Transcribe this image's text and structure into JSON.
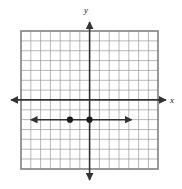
{
  "figure": {
    "background_color": "#ffffff"
  },
  "axes": {
    "x_label": "x",
    "y_label": "y",
    "axis_color": "#333333",
    "arrow_directions": [
      "left",
      "right",
      "up",
      "down"
    ]
  },
  "grid": {
    "line_color": "#9a9a9a",
    "border_color": "#808080",
    "columns": 14,
    "rows": 14,
    "x_range": [
      -7,
      7
    ],
    "y_range": [
      -7,
      7
    ],
    "show_tick_labels": false
  },
  "chart_data": {
    "type": "scatter",
    "title": "",
    "xlabel": "x",
    "ylabel": "y",
    "xlim": [
      -7,
      7
    ],
    "ylim": [
      -7,
      7
    ],
    "grid": true,
    "legend": "none",
    "points": [
      {
        "label": "point-1",
        "x": -2,
        "y": -2,
        "style": "filled-circle"
      },
      {
        "label": "point-2",
        "x": 0,
        "y": -2,
        "style": "filled-circle"
      }
    ],
    "series": [
      {
        "name": "horizontal-ray",
        "type": "line",
        "y_value": -2,
        "x_start": -6,
        "x_end": 4.3,
        "arrow_start": true,
        "arrow_end": true,
        "color": "#333333"
      }
    ]
  }
}
